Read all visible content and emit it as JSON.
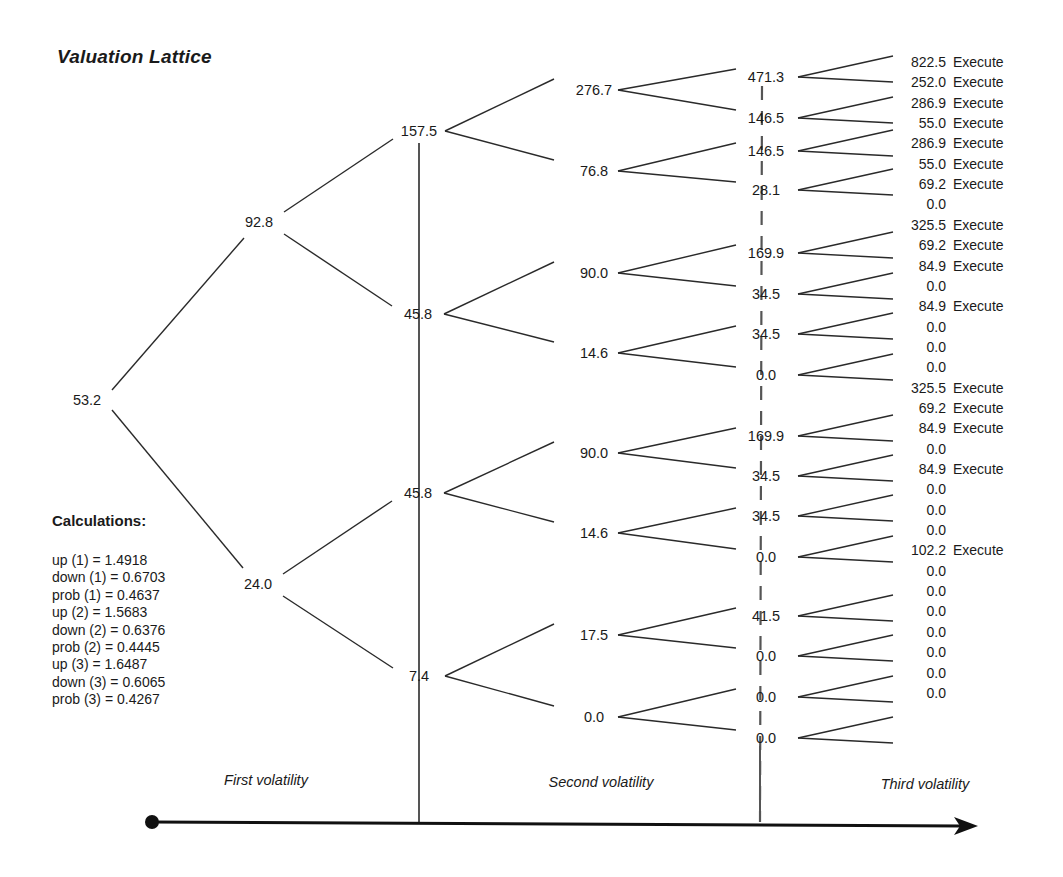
{
  "title": "Valuation Lattice",
  "calculations": {
    "heading": "Calculations:",
    "lines": [
      "up (1) = 1.4918",
      "down (1) = 0.6703",
      "prob (1) = 0.4637",
      "up (2) = 1.5683",
      "down (2) = 0.6376",
      "prob (2) = 0.4445",
      "up (3) = 1.6487",
      "down (3) = 0.6065",
      "prob (3) = 0.4267"
    ]
  },
  "axis": {
    "labels": [
      "First volatility",
      "Second volatility",
      "Third volatility"
    ]
  },
  "lattice": {
    "root": "53.2",
    "level1": [
      "92.8",
      "24.0"
    ],
    "level2": [
      "157.5",
      "45.8",
      "45.8",
      "7.4"
    ],
    "level3": [
      "276.7",
      "76.8",
      "90.0",
      "14.6",
      "90.0",
      "14.6",
      "17.5",
      "0.0"
    ],
    "level4": [
      "471.3",
      "146.5",
      "146.5",
      "28.1",
      "169.9",
      "34.5",
      "34.5",
      "0.0",
      "169.9",
      "34.5",
      "34.5",
      "0.0",
      "41.5",
      "0.0",
      "0.0",
      "0.0"
    ],
    "leaves": [
      {
        "value": "822.5",
        "action": "Execute"
      },
      {
        "value": "252.0",
        "action": "Execute"
      },
      {
        "value": "286.9",
        "action": "Execute"
      },
      {
        "value": "55.0",
        "action": "Execute"
      },
      {
        "value": "286.9",
        "action": "Execute"
      },
      {
        "value": "55.0",
        "action": "Execute"
      },
      {
        "value": "69.2",
        "action": "Execute"
      },
      {
        "value": "0.0",
        "action": ""
      },
      {
        "value": "325.5",
        "action": "Execute"
      },
      {
        "value": "69.2",
        "action": "Execute"
      },
      {
        "value": "84.9",
        "action": "Execute"
      },
      {
        "value": "0.0",
        "action": ""
      },
      {
        "value": "84.9",
        "action": "Execute"
      },
      {
        "value": "0.0",
        "action": ""
      },
      {
        "value": "0.0",
        "action": ""
      },
      {
        "value": "0.0",
        "action": ""
      },
      {
        "value": "325.5",
        "action": "Execute"
      },
      {
        "value": "69.2",
        "action": "Execute"
      },
      {
        "value": "84.9",
        "action": "Execute"
      },
      {
        "value": "0.0",
        "action": ""
      },
      {
        "value": "84.9",
        "action": "Execute"
      },
      {
        "value": "0.0",
        "action": ""
      },
      {
        "value": "0.0",
        "action": ""
      },
      {
        "value": "0.0",
        "action": ""
      },
      {
        "value": "102.2",
        "action": "Execute"
      },
      {
        "value": "0.0",
        "action": ""
      },
      {
        "value": "0.0",
        "action": ""
      },
      {
        "value": "0.0",
        "action": ""
      },
      {
        "value": "0.0",
        "action": ""
      },
      {
        "value": "0.0",
        "action": ""
      },
      {
        "value": "0.0",
        "action": ""
      },
      {
        "value": "0.0",
        "action": ""
      }
    ]
  },
  "colors": {
    "line": "#2a2a2a",
    "text": "#1a1a1a",
    "background": "#ffffff"
  }
}
